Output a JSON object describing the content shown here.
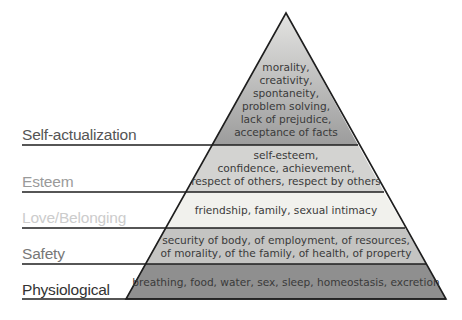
{
  "levels": [
    {
      "name": "Self-actualization",
      "label_color": "#555555",
      "fill": "gradient",
      "text": "morality,\ncreativity,\nspontaneity,\nproblem solving,\nlack of prejudice,\nacceptance of facts"
    },
    {
      "name": "Esteem",
      "label_color": "#9a9a9a",
      "fill": "#d3d3d1",
      "text": "self-esteem,\nconfidence, achievement,\nrespect of others, respect by others"
    },
    {
      "name": "Love/Belonging",
      "label_color": "#cccccc",
      "fill": "#f1f1ed",
      "text": "friendship, family, sexual intimacy"
    },
    {
      "name": "Safety",
      "label_color": "#777777",
      "fill": "#c4c4c2",
      "text": "security of body, of employment, of resources,\nof morality, of the family, of health, of property"
    },
    {
      "name": "Physiological",
      "label_color": "#333333",
      "fill": "#8f8f8f",
      "text": "breathing, food, water, sex, sleep, homeostasis, excretion"
    }
  ],
  "colors": {
    "outline": "#1e1e1e",
    "top_gradient_start": "#e4e4e2",
    "top_gradient_end": "#9c9c9c"
  }
}
